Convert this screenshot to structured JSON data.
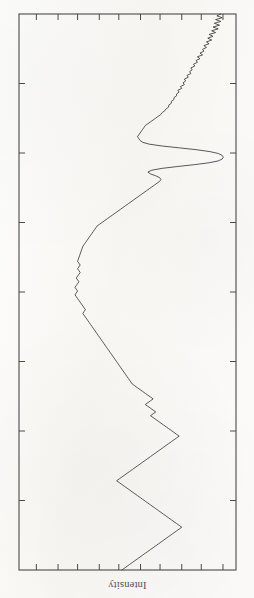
{
  "figure": {
    "kind": "scanned-plot",
    "orientation": "rotated-180",
    "axis_label_bottom": "Intensity",
    "frame_color": "#4a4a48",
    "curve_color": "#3b3b39",
    "background_color": "#fbfbf9"
  },
  "chart_data": {
    "type": "line",
    "title": "",
    "subtitle": "",
    "xlabel": "Intensity",
    "ylabel": "",
    "grid": false,
    "legend": [],
    "legend_position": "none",
    "note": "Scanned spectrum printed upside-down; intensity runs along the horizontal axis and the profile coordinate runs vertically. Axes are unlabelled apart from the rotated 'Intensity' caption. Values below are read off the frame as fractions of the plot box: x = intensity (0 at left frame, 1 at right frame), y = profile position (0 at top frame, 1 at bottom frame).",
    "axis_ranges": {
      "x": [
        0,
        1
      ],
      "y": [
        0,
        1
      ]
    },
    "ticks": {
      "top": [
        0.08,
        0.18,
        0.27,
        0.37,
        0.46,
        0.56,
        0.65,
        0.75,
        0.84,
        0.94
      ],
      "bottom": [
        0.08,
        0.18,
        0.27,
        0.37,
        0.46,
        0.56,
        0.65,
        0.75,
        0.84,
        0.94
      ],
      "left": [
        0.125,
        0.25,
        0.375,
        0.5,
        0.625,
        0.75,
        0.875
      ],
      "right": [
        0.125,
        0.25,
        0.375,
        0.5,
        0.625,
        0.75,
        0.875
      ],
      "tick_direction": "inward",
      "tick_labels": []
    },
    "series": [
      {
        "name": "profile",
        "x": [
          0.93,
          0.912,
          0.936,
          0.906,
          0.93,
          0.9,
          0.924,
          0.894,
          0.918,
          0.888,
          0.906,
          0.876,
          0.894,
          0.87,
          0.888,
          0.864,
          0.876,
          0.852,
          0.864,
          0.846,
          0.852,
          0.834,
          0.846,
          0.822,
          0.834,
          0.816,
          0.822,
          0.804,
          0.81,
          0.792,
          0.798,
          0.786,
          0.792,
          0.774,
          0.78,
          0.762,
          0.768,
          0.756,
          0.762,
          0.744,
          0.75,
          0.732,
          0.738,
          0.726,
          0.726,
          0.714,
          0.714,
          0.702,
          0.702,
          0.69,
          0.69,
          0.678,
          0.672,
          0.66,
          0.654,
          0.642,
          0.63,
          0.618,
          0.606,
          0.594,
          0.582,
          0.576,
          0.57,
          0.564,
          0.558,
          0.552,
          0.546,
          0.552,
          0.558,
          0.57,
          0.6,
          0.66,
          0.74,
          0.82,
          0.88,
          0.918,
          0.936,
          0.942,
          0.936,
          0.918,
          0.876,
          0.81,
          0.732,
          0.66,
          0.612,
          0.594,
          0.606,
          0.63,
          0.648,
          0.654,
          0.648,
          0.636,
          0.624,
          0.612,
          0.6,
          0.588,
          0.576,
          0.564,
          0.552,
          0.54,
          0.528,
          0.516,
          0.504,
          0.492,
          0.48,
          0.468,
          0.456,
          0.444,
          0.432,
          0.42,
          0.408,
          0.396,
          0.384,
          0.372,
          0.36,
          0.354,
          0.348,
          0.342,
          0.336,
          0.33,
          0.324,
          0.318,
          0.312,
          0.306,
          0.3,
          0.294,
          0.291,
          0.288,
          0.285,
          0.282,
          0.279,
          0.276,
          0.273,
          0.27,
          0.276,
          0.282,
          0.276,
          0.27,
          0.276,
          0.282,
          0.276,
          0.27,
          0.264,
          0.27,
          0.276,
          0.27,
          0.264,
          0.258,
          0.264,
          0.27,
          0.264,
          0.258,
          0.264,
          0.27,
          0.276,
          0.282,
          0.288,
          0.294,
          0.3,
          0.306,
          0.3,
          0.294,
          0.3,
          0.306,
          0.312,
          0.318,
          0.324,
          0.33,
          0.336,
          0.342,
          0.348,
          0.354,
          0.36,
          0.366,
          0.372,
          0.378,
          0.384,
          0.39,
          0.396,
          0.402,
          0.408,
          0.414,
          0.42,
          0.426,
          0.432,
          0.438,
          0.444,
          0.45,
          0.456,
          0.462,
          0.468,
          0.474,
          0.48,
          0.486,
          0.492,
          0.498,
          0.504,
          0.51,
          0.516,
          0.522,
          0.534,
          0.546,
          0.558,
          0.57,
          0.582,
          0.594,
          0.606,
          0.618,
          0.606,
          0.594,
          0.582,
          0.594,
          0.606,
          0.618,
          0.63,
          0.618,
          0.606,
          0.618,
          0.63,
          0.642,
          0.654,
          0.666,
          0.678,
          0.69,
          0.702,
          0.714,
          0.726,
          0.738,
          0.726,
          0.714,
          0.702,
          0.69,
          0.678,
          0.666,
          0.654,
          0.642,
          0.63,
          0.618,
          0.606,
          0.594,
          0.582,
          0.57,
          0.558,
          0.546,
          0.534,
          0.522,
          0.51,
          0.498,
          0.486,
          0.474,
          0.462,
          0.45,
          0.462,
          0.474,
          0.486,
          0.498,
          0.51,
          0.522,
          0.534,
          0.546,
          0.558,
          0.57,
          0.582,
          0.594,
          0.606,
          0.618,
          0.63,
          0.642,
          0.654,
          0.666,
          0.678,
          0.69,
          0.702,
          0.714,
          0.726,
          0.738,
          0.75,
          0.738,
          0.726,
          0.714,
          0.702,
          0.69,
          0.678,
          0.666,
          0.654,
          0.642,
          0.63,
          0.618,
          0.606,
          0.594,
          0.582,
          0.57,
          0.558,
          0.546,
          0.534,
          0.522,
          0.51,
          0.498,
          0.486,
          0.474
        ],
        "y": [
          0.0,
          0.006,
          0.012,
          0.018,
          0.024,
          0.03,
          0.036,
          0.042,
          0.048,
          0.054,
          0.06,
          0.066,
          0.072,
          0.078,
          0.084,
          0.09,
          0.096,
          0.102,
          0.108,
          0.114,
          0.12,
          0.126,
          0.132,
          0.138,
          0.144,
          0.15,
          0.156,
          0.162,
          0.168,
          0.174,
          0.18,
          0.186,
          0.192,
          0.198,
          0.204,
          0.21,
          0.216,
          0.222,
          0.228,
          0.234,
          0.24,
          0.244,
          0.248,
          0.252,
          0.256,
          0.26,
          0.262,
          0.264,
          0.266,
          0.268,
          0.27,
          0.272,
          0.274,
          0.276,
          0.278,
          0.28,
          0.282,
          0.284,
          0.286,
          0.288,
          0.29,
          0.292,
          0.294,
          0.296,
          0.298,
          0.3,
          0.304,
          0.308,
          0.312,
          0.316,
          0.318,
          0.32,
          0.322,
          0.324,
          0.326,
          0.328,
          0.33,
          0.332,
          0.334,
          0.336,
          0.338,
          0.34,
          0.342,
          0.344,
          0.346,
          0.35,
          0.354,
          0.358,
          0.362,
          0.366,
          0.372,
          0.378,
          0.384,
          0.39,
          0.396,
          0.402,
          0.408,
          0.414,
          0.42,
          0.426,
          0.432,
          0.438,
          0.444,
          0.45,
          0.456,
          0.462,
          0.468,
          0.474,
          0.48,
          0.486,
          0.492,
          0.498,
          0.504,
          0.51,
          0.516,
          0.522,
          0.528,
          0.534,
          0.54,
          0.546,
          0.552,
          0.558,
          0.564,
          0.57,
          0.576,
          0.582,
          0.588,
          0.594,
          0.6,
          0.606,
          0.612,
          0.618,
          0.624,
          0.63,
          0.636,
          0.642,
          0.648,
          0.654,
          0.66,
          0.666,
          0.672,
          0.678,
          0.684,
          0.69,
          0.696,
          0.702,
          0.708,
          0.714,
          0.72,
          0.726,
          0.732,
          0.738,
          0.744,
          0.75,
          0.756,
          0.762,
          0.768,
          0.774,
          0.78,
          0.786,
          0.792,
          0.798,
          0.804,
          0.81,
          0.816,
          0.822,
          0.828,
          0.834,
          0.84,
          0.846,
          0.852,
          0.858,
          0.864,
          0.87,
          0.876,
          0.882,
          0.888,
          0.894,
          0.9,
          0.906,
          0.912,
          0.918,
          0.924,
          0.93,
          0.936,
          0.942,
          0.948,
          0.954,
          0.96,
          0.966,
          0.972,
          0.978,
          0.984,
          0.99,
          0.994,
          0.997,
          0.999,
          1.0,
          1.0,
          1.0,
          1.0,
          1.0,
          1.0,
          1.0,
          1.0,
          1.0,
          1.0,
          1.0,
          1.0,
          1.0,
          1.0,
          1.0,
          1.0,
          1.0,
          1.0,
          1.0,
          1.0,
          1.0,
          1.0,
          1.0,
          1.0,
          1.0,
          1.0,
          1.0,
          1.0,
          1.0,
          1.0,
          1.0,
          1.0,
          1.0,
          1.0,
          1.0,
          1.0,
          1.0,
          1.0,
          1.0,
          1.0,
          1.0,
          1.0,
          1.0,
          1.0,
          1.0,
          1.0,
          1.0,
          1.0,
          1.0,
          1.0,
          1.0,
          1.0,
          1.0,
          1.0,
          1.0,
          1.0,
          1.0,
          1.0,
          1.0,
          1.0,
          1.0,
          1.0,
          1.0,
          1.0,
          1.0,
          1.0,
          1.0,
          1.0,
          1.0,
          1.0,
          1.0,
          1.0,
          1.0,
          1.0,
          1.0,
          1.0,
          1.0,
          1.0,
          1.0,
          1.0,
          1.0,
          1.0,
          1.0,
          1.0,
          1.0,
          1.0,
          1.0,
          1.0,
          1.0,
          1.0,
          1.0,
          1.0,
          1.0,
          1.0,
          1.0,
          1.0,
          1.0,
          1.0,
          1.0,
          1.0,
          1.0,
          1.0,
          1.0
        ],
        "features": [
          {
            "name": "main-peak",
            "y": 0.278,
            "x_max": 0.945,
            "description": "tall narrow peak reaching near the right frame"
          },
          {
            "name": "shoulder",
            "y": 0.3,
            "x": 0.66,
            "description": "small shoulder just below the main peak"
          },
          {
            "name": "plateau-edge",
            "y": 0.33,
            "x": 0.56,
            "description": "steep rise forming the left edge of the peak"
          },
          {
            "name": "secondary-peak",
            "y": 0.7,
            "x_max": 0.76,
            "description": "broad secondary peak in the lower half"
          }
        ]
      }
    ]
  },
  "plot_geometry": {
    "frame": {
      "left": 19,
      "top": 14,
      "right": 236,
      "bottom": 570
    },
    "tick_length": 6,
    "frame_stroke_width": 1.1,
    "curve_stroke_width": 0.85
  }
}
